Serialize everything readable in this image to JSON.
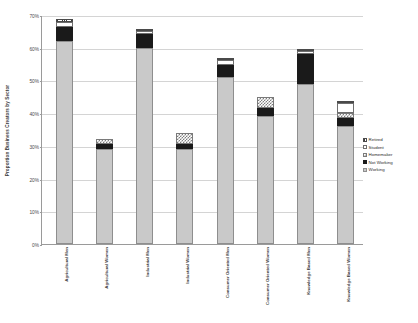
{
  "chart_data": {
    "type": "bar",
    "title": "",
    "xlabel": "",
    "ylabel": "Proportion Business Creators by Sector",
    "ylim": [
      0,
      70
    ],
    "ytick_labels": [
      "0%",
      "10%",
      "20%",
      "30%",
      "40%",
      "50%",
      "60%",
      "70%"
    ],
    "ytick_values": [
      0,
      10,
      20,
      30,
      40,
      50,
      60,
      70
    ],
    "grid": true,
    "stacked": true,
    "legend_position": "right",
    "categories": [
      "Agricultural Men",
      "Agricultural Women",
      "Industrial Men",
      "Industrial Women",
      "Consumer Oriented Men",
      "Consumer Oriented Women",
      "Knowledge Based Men",
      "Knowledge Based Women"
    ],
    "series": [
      {
        "name": "Working",
        "values": [
          62.0,
          29.0,
          59.8,
          29.0,
          51.0,
          39.0,
          49.0,
          36.0
        ]
      },
      {
        "name": "Not Working",
        "values": [
          4.2,
          1.6,
          4.3,
          1.6,
          3.6,
          2.6,
          9.0,
          2.5
        ]
      },
      {
        "name": "Homemaker",
        "values": [
          0.0,
          1.6,
          0.0,
          3.4,
          0.0,
          3.4,
          0.0,
          1.6
        ]
      },
      {
        "name": "Student",
        "values": [
          1.8,
          0.0,
          0.9,
          0.0,
          1.6,
          0.0,
          0.9,
          3.0
        ]
      },
      {
        "name": "Retired",
        "values": [
          0.7,
          0.0,
          0.7,
          0.0,
          0.5,
          0.0,
          0.8,
          0.4
        ]
      }
    ],
    "legend_entries": [
      "Retired",
      "Student",
      "Homemaker",
      "Not Working",
      "Working"
    ]
  },
  "legend": {
    "items": [
      {
        "label": "Retired",
        "swatch": "retired-hatch-swatch"
      },
      {
        "label": "Student",
        "swatch": "student-white-swatch"
      },
      {
        "label": "Homemaker",
        "swatch": "homemaker-checker-swatch"
      },
      {
        "label": "Not Working",
        "swatch": "not-working-black-swatch"
      },
      {
        "label": "Working",
        "swatch": "working-gray-swatch"
      }
    ]
  },
  "caption": {
    "text": ""
  },
  "colors": {
    "working": "#c9c9c9",
    "not_working": "#1a1a1a",
    "homemaker": "#7f7f7f",
    "student": "#ffffff",
    "retired": "#3c3c3c",
    "gridline": "#d4d4d4",
    "axis": "#9a9a9a"
  }
}
